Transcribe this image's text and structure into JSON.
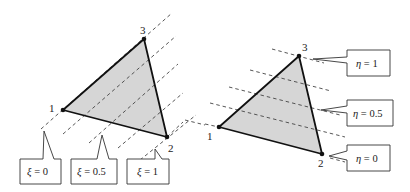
{
  "colors": {
    "triangle_fill": "#d6d6d6",
    "edge": "#111111",
    "dash": "#444444",
    "callout_border": "#333333"
  },
  "left_panel": {
    "nodes": [
      {
        "id": "1",
        "label": "1"
      },
      {
        "id": "2",
        "label": "2"
      },
      {
        "id": "3",
        "label": "3"
      }
    ],
    "callouts": [
      {
        "symbol": "ξ",
        "eq": " = ",
        "value": "0"
      },
      {
        "symbol": "ξ",
        "eq": " = ",
        "value": "0.5"
      },
      {
        "symbol": "ξ",
        "eq": " = ",
        "value": "1"
      }
    ]
  },
  "right_panel": {
    "nodes": [
      {
        "id": "1",
        "label": "1"
      },
      {
        "id": "2",
        "label": "2"
      },
      {
        "id": "3",
        "label": "3"
      }
    ],
    "callouts": [
      {
        "symbol": "η",
        "eq": " = ",
        "value": "1"
      },
      {
        "symbol": "η",
        "eq": " = ",
        "value": "0.5"
      },
      {
        "symbol": "η",
        "eq": " = ",
        "value": "0"
      }
    ]
  }
}
